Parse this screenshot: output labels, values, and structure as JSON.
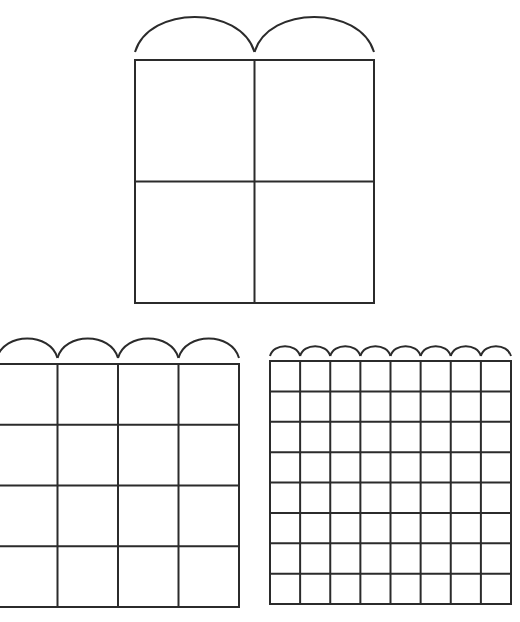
{
  "diagram": {
    "stroke_color": "#2b2b2b",
    "background": "#ffffff",
    "figures": [
      {
        "id": "grid-2x2",
        "rows": 2,
        "cols": 2,
        "x": 135,
        "y": 60,
        "width": 239,
        "height": 243,
        "arc_count": 2,
        "arc_height": 36,
        "arc_gap": 8
      },
      {
        "id": "grid-4x4",
        "rows": 4,
        "cols": 4,
        "x": -3,
        "y": 364,
        "width": 242,
        "height": 243,
        "arc_count": 4,
        "arc_height": 20,
        "arc_gap": 6
      },
      {
        "id": "grid-8x8",
        "rows": 8,
        "cols": 8,
        "x": 270,
        "y": 361,
        "width": 241,
        "height": 243,
        "arc_count": 8,
        "arc_height": 10,
        "arc_gap": 5
      }
    ]
  }
}
